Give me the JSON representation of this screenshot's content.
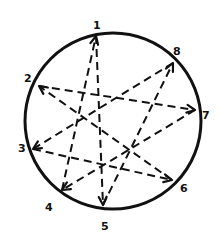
{
  "diagram": {
    "type": "circle-graph",
    "style": "hand-drawn",
    "colors": {
      "stroke": "#111111",
      "background": "#ffffff"
    },
    "nodes": [
      {
        "id": "1",
        "label": "1"
      },
      {
        "id": "2",
        "label": "2"
      },
      {
        "id": "3",
        "label": "3"
      },
      {
        "id": "4",
        "label": "4"
      },
      {
        "id": "5",
        "label": "5"
      },
      {
        "id": "6",
        "label": "6"
      },
      {
        "id": "7",
        "label": "7"
      },
      {
        "id": "8",
        "label": "8"
      }
    ],
    "edges": [
      {
        "from": "1",
        "to": "5",
        "style": "dashed",
        "arrow": "end"
      },
      {
        "from": "4",
        "to": "1",
        "style": "dashed",
        "arrow": "end"
      },
      {
        "from": "5",
        "to": "8",
        "style": "dashed",
        "arrow": "end"
      },
      {
        "from": "8",
        "to": "3",
        "style": "dashed",
        "arrow": "end"
      },
      {
        "from": "3",
        "to": "6",
        "style": "dashed",
        "arrow": "end"
      },
      {
        "from": "6",
        "to": "2",
        "style": "dashed",
        "arrow": "end"
      },
      {
        "from": "2",
        "to": "7",
        "style": "dashed",
        "arrow": "end"
      },
      {
        "from": "7",
        "to": "4",
        "style": "dashed",
        "arrow": "end"
      }
    ]
  }
}
